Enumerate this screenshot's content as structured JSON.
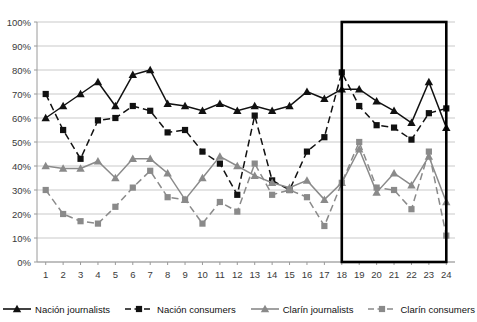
{
  "chart_data": {
    "type": "line",
    "title": "",
    "xlabel": "",
    "ylabel": "",
    "ylim": [
      0,
      100
    ],
    "ytick_labels": [
      "0%",
      "10%",
      "20%",
      "30%",
      "40%",
      "50%",
      "60%",
      "70%",
      "80%",
      "90%",
      "100%"
    ],
    "ytick_values": [
      0,
      10,
      20,
      30,
      40,
      50,
      60,
      70,
      80,
      90,
      100
    ],
    "grid": true,
    "legend_position": "bottom",
    "categories": [
      "1",
      "2",
      "3",
      "4",
      "5",
      "6",
      "7",
      "8",
      "9",
      "10",
      "11",
      "12",
      "13",
      "14",
      "15",
      "16",
      "17",
      "18",
      "19",
      "20",
      "21",
      "22",
      "23",
      "24"
    ],
    "series": [
      {
        "name": "Nación journalists",
        "color": "#111111",
        "marker": "triangle",
        "dash": "solid",
        "values": [
          60,
          65,
          70,
          75,
          65,
          78,
          80,
          66,
          65,
          63,
          66,
          63,
          65,
          63,
          65,
          71,
          68,
          72,
          72,
          67,
          63,
          58,
          75,
          56
        ]
      },
      {
        "name": "Nación consumers",
        "color": "#111111",
        "marker": "square",
        "dash": "dashed",
        "values": [
          70,
          55,
          43,
          59,
          60,
          65,
          63,
          54,
          55,
          46,
          41,
          28,
          61,
          34,
          30,
          46,
          52,
          79,
          65,
          57,
          56,
          51,
          62,
          64
        ]
      },
      {
        "name": "Clarín journalists",
        "color": "#8a8a8a",
        "marker": "triangle",
        "dash": "solid",
        "values": [
          40,
          39,
          39,
          42,
          35,
          43,
          43,
          37,
          26,
          35,
          44,
          40,
          36,
          33,
          31,
          34,
          26,
          33,
          47,
          29,
          37,
          32,
          44,
          25
        ]
      },
      {
        "name": "Clarín consumers",
        "color": "#8a8a8a",
        "marker": "square",
        "dash": "dashed",
        "values": [
          30,
          20,
          17,
          16,
          23,
          31,
          38,
          27,
          26,
          16,
          25,
          21,
          41,
          28,
          30,
          27,
          15,
          33,
          50,
          31,
          30,
          22,
          46,
          11
        ]
      }
    ],
    "highlight_box": {
      "x_start": 17.5,
      "x_end": 23.5,
      "y_start": 0,
      "y_end": 100,
      "color": "#000000"
    }
  }
}
